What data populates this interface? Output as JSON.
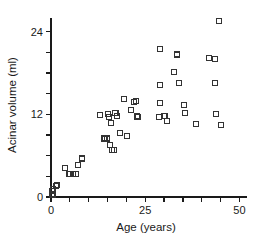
{
  "chart_data": {
    "type": "scatter",
    "title": "",
    "xlabel": "Age (years)",
    "ylabel": "Acinar volume (ml)",
    "xlim": [
      0,
      52
    ],
    "ylim": [
      0,
      26
    ],
    "xticks": [
      0,
      5,
      10,
      15,
      20,
      25,
      30,
      35,
      40,
      45,
      50
    ],
    "xticklabels": [
      "0",
      "",
      "",
      "",
      "",
      "25",
      "",
      "",
      "",
      "",
      "50"
    ],
    "yticks": [
      0,
      3,
      6,
      9,
      12,
      15,
      18,
      21,
      24
    ],
    "yticklabels": [
      "0",
      "",
      "",
      "",
      "12",
      "",
      "",
      "",
      "24"
    ],
    "grid": false,
    "legend": null,
    "marker": "open-square",
    "marker_color": "#333333",
    "points": [
      {
        "x": 0.2,
        "y": 0.5
      },
      {
        "x": 0.3,
        "y": 0.9
      },
      {
        "x": 0.4,
        "y": 0.3
      },
      {
        "x": 0.6,
        "y": 1.2
      },
      {
        "x": 1.3,
        "y": 1.6
      },
      {
        "x": 1.6,
        "y": 1.7
      },
      {
        "x": 3.6,
        "y": 4.2
      },
      {
        "x": 4.9,
        "y": 3.4
      },
      {
        "x": 5.8,
        "y": 3.4
      },
      {
        "x": 6.6,
        "y": 3.4
      },
      {
        "x": 7.1,
        "y": 4.7
      },
      {
        "x": 8.3,
        "y": 5.6
      },
      {
        "x": 13.0,
        "y": 11.9
      },
      {
        "x": 14.2,
        "y": 8.5
      },
      {
        "x": 14.9,
        "y": 8.5
      },
      {
        "x": 15.1,
        "y": 12.0
      },
      {
        "x": 15.3,
        "y": 11.6
      },
      {
        "x": 15.6,
        "y": 7.6
      },
      {
        "x": 15.9,
        "y": 10.7
      },
      {
        "x": 16.3,
        "y": 6.8
      },
      {
        "x": 16.6,
        "y": 6.8
      },
      {
        "x": 17.1,
        "y": 12.2
      },
      {
        "x": 17.4,
        "y": 11.8
      },
      {
        "x": 18.4,
        "y": 9.3
      },
      {
        "x": 19.3,
        "y": 14.2
      },
      {
        "x": 20.2,
        "y": 8.9
      },
      {
        "x": 21.3,
        "y": 12.7
      },
      {
        "x": 22.0,
        "y": 13.8
      },
      {
        "x": 22.6,
        "y": 13.9
      },
      {
        "x": 22.8,
        "y": 11.7
      },
      {
        "x": 23.0,
        "y": 11.6
      },
      {
        "x": 28.8,
        "y": 21.5
      },
      {
        "x": 28.9,
        "y": 16.3
      },
      {
        "x": 29.0,
        "y": 13.7
      },
      {
        "x": 28.6,
        "y": 11.6
      },
      {
        "x": 30.1,
        "y": 11.8
      },
      {
        "x": 30.8,
        "y": 11.1
      },
      {
        "x": 32.6,
        "y": 18.2
      },
      {
        "x": 33.5,
        "y": 20.7
      },
      {
        "x": 34.0,
        "y": 16.6
      },
      {
        "x": 35.3,
        "y": 13.3
      },
      {
        "x": 35.6,
        "y": 12.2
      },
      {
        "x": 38.5,
        "y": 10.6
      },
      {
        "x": 42.0,
        "y": 20.2
      },
      {
        "x": 43.4,
        "y": 20.1
      },
      {
        "x": 43.6,
        "y": 16.5
      },
      {
        "x": 43.8,
        "y": 12.1
      },
      {
        "x": 44.5,
        "y": 25.5
      },
      {
        "x": 45.0,
        "y": 10.4
      }
    ]
  }
}
